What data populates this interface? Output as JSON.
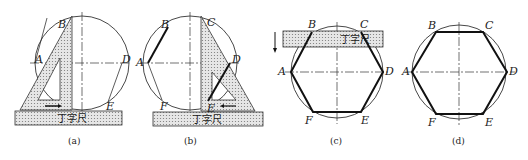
{
  "figure": {
    "tool_label": "丁字尺",
    "panels": [
      {
        "id": "a",
        "caption": "(a)",
        "points": {
          "A": "A",
          "B": "B",
          "D": "D",
          "E": "E"
        }
      },
      {
        "id": "b",
        "caption": "(b)",
        "points": {
          "A": "A",
          "B": "B",
          "C": "C",
          "D": "D",
          "E": "E",
          "F": "F"
        }
      },
      {
        "id": "c",
        "caption": "(c)",
        "points": {
          "A": "A",
          "B": "B",
          "C": "C",
          "D": "D",
          "E": "E",
          "F": "F"
        }
      },
      {
        "id": "d",
        "caption": "(d)",
        "points": {
          "A": "A",
          "B": "B",
          "C": "C",
          "D": "D",
          "E": "E",
          "F": "F"
        }
      }
    ]
  }
}
